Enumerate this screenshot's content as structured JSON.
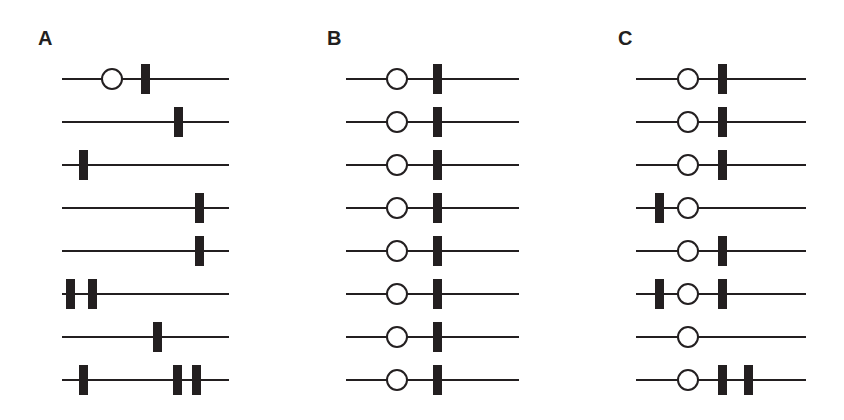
{
  "figure": {
    "background_color": "#ffffff",
    "ink_color": "#231f20",
    "width": 844,
    "height": 420,
    "row_count": 8,
    "row_spacing": 43,
    "first_row_y": 79,
    "line_thickness": 2,
    "circle_diameter": 22,
    "bar_width": 9,
    "bar_height": 30
  },
  "panels": [
    {
      "label": "A",
      "name": "panel-a",
      "label_x": 38,
      "label_y": 28,
      "line_x": 62,
      "line_width": 167,
      "rows": [
        {
          "circles": [
            112
          ],
          "bars": [
            145
          ]
        },
        {
          "circles": [],
          "bars": [
            178
          ]
        },
        {
          "circles": [],
          "bars": [
            83
          ]
        },
        {
          "circles": [],
          "bars": [
            199
          ]
        },
        {
          "circles": [],
          "bars": [
            199
          ]
        },
        {
          "circles": [],
          "bars": [
            70,
            92
          ]
        },
        {
          "circles": [],
          "bars": [
            157
          ]
        },
        {
          "circles": [],
          "bars": [
            83,
            177,
            196
          ]
        }
      ]
    },
    {
      "label": "B",
      "name": "panel-b",
      "label_x": 327,
      "label_y": 28,
      "line_x": 346,
      "line_width": 173,
      "rows": [
        {
          "circles": [
            397
          ],
          "bars": [
            437
          ]
        },
        {
          "circles": [
            397
          ],
          "bars": [
            437
          ]
        },
        {
          "circles": [
            397
          ],
          "bars": [
            437
          ]
        },
        {
          "circles": [
            397
          ],
          "bars": [
            437
          ]
        },
        {
          "circles": [
            397
          ],
          "bars": [
            437
          ]
        },
        {
          "circles": [
            397
          ],
          "bars": [
            437
          ]
        },
        {
          "circles": [
            397
          ],
          "bars": [
            437
          ]
        },
        {
          "circles": [
            397
          ],
          "bars": [
            437
          ]
        }
      ]
    },
    {
      "label": "C",
      "name": "panel-c",
      "label_x": 618,
      "label_y": 28,
      "line_x": 636,
      "line_width": 170,
      "rows": [
        {
          "circles": [
            688
          ],
          "bars": [
            722
          ]
        },
        {
          "circles": [
            688
          ],
          "bars": [
            722
          ]
        },
        {
          "circles": [
            688
          ],
          "bars": [
            722
          ]
        },
        {
          "circles": [
            688
          ],
          "bars": [
            659
          ]
        },
        {
          "circles": [
            688
          ],
          "bars": [
            722
          ]
        },
        {
          "circles": [
            688
          ],
          "bars": [
            659,
            722
          ]
        },
        {
          "circles": [
            688
          ],
          "bars": []
        },
        {
          "circles": [
            688
          ],
          "bars": [
            722,
            748
          ]
        }
      ]
    }
  ]
}
